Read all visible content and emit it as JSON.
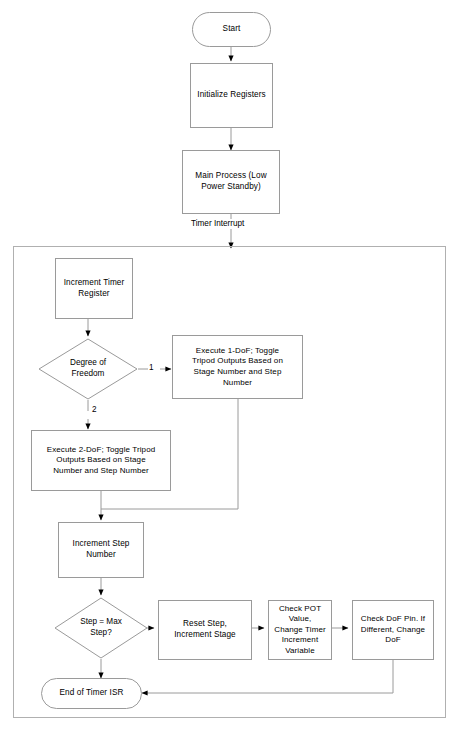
{
  "diagram": {
    "type": "flowchart",
    "line_color": "#9a9a9a",
    "arrow_color": "#000000",
    "text_color": "#000000",
    "background_color": "#ffffff"
  },
  "nodes": {
    "start": {
      "label": "Start",
      "shape": "terminal"
    },
    "init_registers": {
      "label": "Initialize Registers",
      "shape": "process"
    },
    "main_process": {
      "label": "Main Process (Low\nPower Standby)",
      "shape": "process"
    },
    "increment_timer": {
      "label": "Increment Timer\nRegister",
      "shape": "process"
    },
    "degree_of_freedom": {
      "label": "Degree of\nFreedom",
      "shape": "decision"
    },
    "execute_1dof": {
      "label": "Execute 1-DoF;  Toggle\nTripod Outputs Based on\nStage Number and Step\nNumber",
      "shape": "process"
    },
    "execute_2dof": {
      "label": "Execute 2-DoF; Toggle Tripod\nOutputs Based on Stage\nNumber and Step Number",
      "shape": "process"
    },
    "increment_step": {
      "label": "Increment Step\nNumber",
      "shape": "process"
    },
    "step_max": {
      "label": "Step = Max\nStep?",
      "shape": "decision"
    },
    "reset_step": {
      "label": "Reset Step,\nIncrement Stage",
      "shape": "process"
    },
    "check_pot": {
      "label": "Check POT Value,\nChange Timer\nIncrement Variable",
      "shape": "process"
    },
    "check_dof_pin": {
      "label": "Check DoF Pin.  If\nDifferent, Change\nDoF",
      "shape": "process"
    },
    "end_isr": {
      "label": "End of Timer ISR",
      "shape": "terminal"
    }
  },
  "edge_labels": {
    "timer_interrupt": "Timer Interrupt",
    "dof_branch_1": "1",
    "dof_branch_2": "2"
  },
  "container": {
    "name": "timer-isr-region",
    "label": ""
  }
}
